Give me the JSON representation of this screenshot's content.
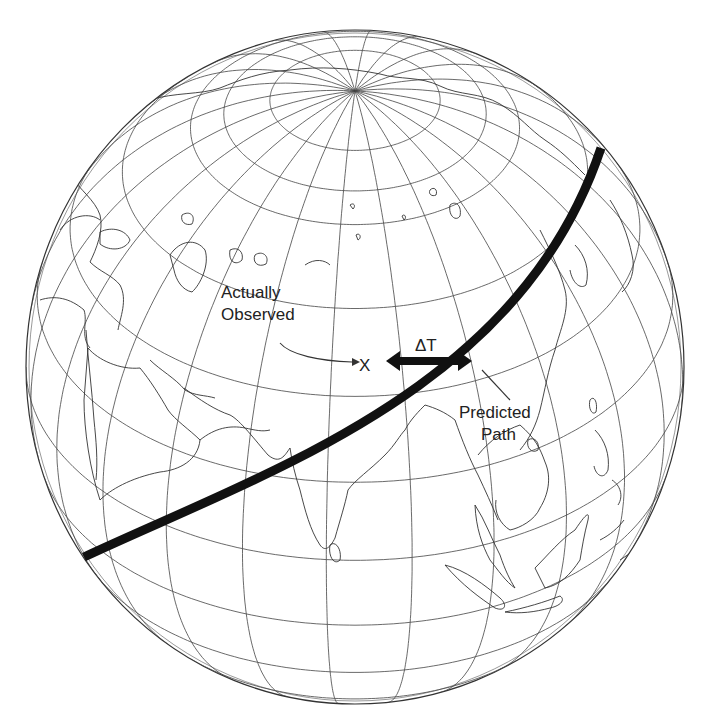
{
  "figure": {
    "type": "orthographic-globe-diagram",
    "background": "#ffffff",
    "line_color": "#333333",
    "path_color": "#111111"
  },
  "globe": {
    "cx": 355,
    "cy": 367,
    "rx": 329,
    "ry": 337,
    "center_lat": 35,
    "center_lon": 80,
    "graticule_step_lon": 15,
    "graticule_step_lat": 15
  },
  "labels": {
    "actually_observed_line1": "Actually",
    "actually_observed_line2": "Observed",
    "observed_marker": "X",
    "delta_t": "ΔT",
    "predicted_path_line1": "Predicted",
    "predicted_path_line2": "Path"
  },
  "predicted_path": {
    "start": [
      84,
      557
    ],
    "control1": [
      270,
      470
    ],
    "control2": [
      520,
      390
    ],
    "end": [
      601,
      148
    ],
    "stroke_width": 9
  },
  "delta_t_arrow": {
    "x1": 386,
    "x2": 472,
    "y": 361
  }
}
